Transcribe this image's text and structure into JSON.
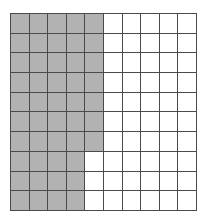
{
  "figure": {
    "name": "shaded-fraction-grid",
    "rows": 10,
    "columns": 10,
    "total_cells": 100,
    "shaded_cells": 47,
    "unshaded_cells": 53,
    "shaded_fraction": "47/100",
    "shaded_percent": 47,
    "shaded_decimal": 0.47,
    "colors": {
      "shaded_fill": "#b2b2b2",
      "unshaded_fill": "#ffffff",
      "grid_line": "#4a4a4a",
      "background": "#ffffff"
    },
    "shaded_per_row": [
      5,
      5,
      5,
      5,
      5,
      5,
      5,
      4,
      4,
      4
    ],
    "cells": [
      [
        1,
        1,
        1,
        1,
        1,
        0,
        0,
        0,
        0,
        0
      ],
      [
        1,
        1,
        1,
        1,
        1,
        0,
        0,
        0,
        0,
        0
      ],
      [
        1,
        1,
        1,
        1,
        1,
        0,
        0,
        0,
        0,
        0
      ],
      [
        1,
        1,
        1,
        1,
        1,
        0,
        0,
        0,
        0,
        0
      ],
      [
        1,
        1,
        1,
        1,
        1,
        0,
        0,
        0,
        0,
        0
      ],
      [
        1,
        1,
        1,
        1,
        1,
        0,
        0,
        0,
        0,
        0
      ],
      [
        1,
        1,
        1,
        1,
        1,
        0,
        0,
        0,
        0,
        0
      ],
      [
        1,
        1,
        1,
        1,
        0,
        0,
        0,
        0,
        0,
        0
      ],
      [
        1,
        1,
        1,
        1,
        0,
        0,
        0,
        0,
        0,
        0
      ],
      [
        1,
        1,
        1,
        1,
        0,
        0,
        0,
        0,
        0,
        0
      ]
    ]
  }
}
